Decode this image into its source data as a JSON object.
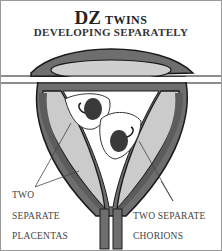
{
  "title": {
    "main": "DZ",
    "suffix": "TWINS"
  },
  "subtitle": "DEVELOPING SEPARATELY",
  "labels": {
    "placentas": [
      "TWO",
      "SEPARATE",
      "PLACENTAS"
    ],
    "chorions": [
      "TWO SEPARATE",
      "CHORIONS"
    ]
  },
  "colors": {
    "dark_gray": "#6e6e6e",
    "light_gray": "#c8c8c8",
    "outline": "#1a1a1a"
  }
}
